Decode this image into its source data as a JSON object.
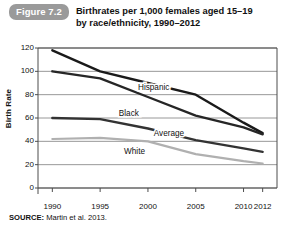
{
  "figure": {
    "badge": "Figure 7.2",
    "title_line1": "Birthrates per 1,000 females aged 15–19",
    "title_line2": "by race/ethnicity, 1990–2012",
    "source_label": "SOURCE:",
    "source_text": "Martin et al. 2013."
  },
  "colors": {
    "hispanic": "#1a1a1a",
    "black": "#262626",
    "average": "#333333",
    "white": "#b0b0b0",
    "grid": "#8c8c8c",
    "axis": "#4d4d4d",
    "badge": "#9a9a9a"
  },
  "chart_data": {
    "type": "line",
    "title": "Birthrates per 1,000 females aged 15–19 by race/ethnicity, 1990–2012",
    "xlabel": "",
    "ylabel": "Birth Rate",
    "xlim": [
      1988.5,
      2013.5
    ],
    "ylim": [
      0,
      120
    ],
    "yticks": [
      0,
      20,
      40,
      60,
      80,
      100,
      120
    ],
    "xticks": [
      1990,
      1995,
      2000,
      2005,
      2010,
      2012
    ],
    "grid": "horizontal",
    "legend": "inline-labels",
    "x": [
      1990,
      1995,
      2000,
      2005,
      2010,
      2012
    ],
    "series": [
      {
        "name": "Hispanic",
        "values": [
          118,
          100,
          90,
          80,
          56,
          47
        ],
        "label_x": 2000.6,
        "label_y": 84
      },
      {
        "name": "Black",
        "values": [
          100,
          94,
          78,
          62,
          52,
          46
        ],
        "label_x": 1998.0,
        "label_y": 62
      },
      {
        "name": "Average",
        "values": [
          60,
          59,
          51,
          41,
          34,
          31
        ],
        "label_x": 2002.2,
        "label_y": 45
      },
      {
        "name": "White",
        "values": [
          42,
          43,
          40,
          29,
          23,
          21
        ],
        "label_x": 1998.6,
        "label_y": 29
      }
    ]
  }
}
